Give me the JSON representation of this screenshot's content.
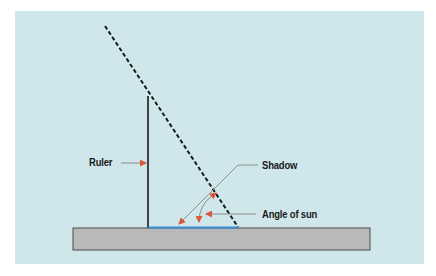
{
  "diagram": {
    "labels": {
      "ruler": "Ruler",
      "shadow": "Shadow",
      "angle": "Angle of sun"
    },
    "colors": {
      "background": "#cfe7ea",
      "ground": "#b9b9b9",
      "ground_border": "#4a4a4a",
      "ruler": "#1a1a1a",
      "sun_ray": "#1a1a1a",
      "shadow": "#3a8fd6",
      "leader_line": "#8c8c8c",
      "arrowhead": "#d9573a"
    }
  }
}
